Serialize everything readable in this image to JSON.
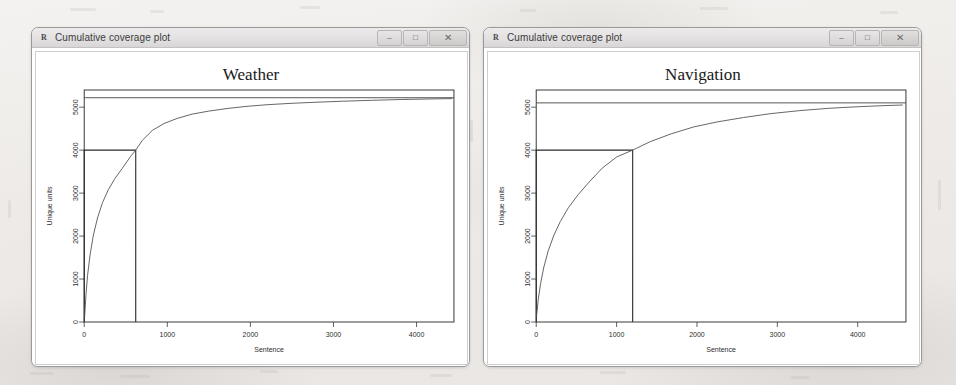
{
  "page": {
    "background_color": "#f0eeec",
    "paper_scan": true
  },
  "windows": [
    {
      "id": "weather-window",
      "titlebar": {
        "icon": "r-graphics-icon",
        "title": "Cumulative coverage plot",
        "buttons": [
          {
            "name": "minimize-button",
            "glyph": "–"
          },
          {
            "name": "maximize-button",
            "glyph": "□"
          },
          {
            "name": "close-button",
            "glyph": "✕"
          }
        ]
      },
      "chart_data": {
        "type": "line",
        "title": "Weather",
        "xlabel": "Sentence",
        "ylabel": "Unique units",
        "xlim": [
          0,
          4450
        ],
        "ylim": [
          0,
          5400
        ],
        "xticks": [
          0,
          1000,
          2000,
          3000,
          4000
        ],
        "yticks": [
          0,
          1000,
          2000,
          3000,
          4000,
          5000
        ],
        "grid": false,
        "legend": null,
        "series": [
          {
            "name": "Cumulative unique units",
            "x": [
              5,
              20,
              40,
              70,
              110,
              160,
              220,
              290,
              370,
              460,
              560,
              620,
              700,
              820,
              960,
              1120,
              1300,
              1500,
              1720,
              1960,
              2220,
              2500,
              2800,
              3120,
              3460,
              3820,
              4200,
              4430
            ],
            "y": [
              120,
              620,
              1080,
              1560,
              2020,
              2420,
              2780,
              3080,
              3340,
              3580,
              3860,
              4000,
              4230,
              4460,
              4620,
              4740,
              4840,
              4910,
              4970,
              5020,
              5060,
              5090,
              5115,
              5140,
              5160,
              5178,
              5192,
              5200
            ]
          }
        ],
        "annotations": [
          {
            "name": "asymptote-line",
            "type": "hline",
            "y": 5220,
            "label": null
          },
          {
            "name": "threshold-rectangle",
            "type": "rect",
            "x0": 0,
            "y0": 0,
            "x1": 620,
            "y1": 4000,
            "label": null
          }
        ]
      }
    },
    {
      "id": "navigation-window",
      "titlebar": {
        "icon": "r-graphics-icon",
        "title": "Cumulative coverage plot",
        "buttons": [
          {
            "name": "minimize-button",
            "glyph": "–"
          },
          {
            "name": "maximize-button",
            "glyph": "□"
          },
          {
            "name": "close-button",
            "glyph": "✕"
          }
        ]
      },
      "chart_data": {
        "type": "line",
        "title": "Navigation",
        "xlabel": "Sentence",
        "ylabel": "Unique units",
        "xlim": [
          0,
          4600
        ],
        "ylim": [
          0,
          5400
        ],
        "xticks": [
          0,
          1000,
          2000,
          3000,
          4000
        ],
        "yticks": [
          0,
          1000,
          2000,
          3000,
          4000,
          5000
        ],
        "grid": false,
        "legend": null,
        "series": [
          {
            "name": "Cumulative unique units",
            "x": [
              5,
              25,
              55,
              95,
              150,
              220,
              300,
              400,
              520,
              660,
              820,
              1000,
              1200,
              1420,
              1680,
              1960,
              2260,
              2580,
              2920,
              3280,
              3640,
              3980,
              4300,
              4560
            ],
            "y": [
              150,
              520,
              900,
              1280,
              1660,
              2020,
              2340,
              2660,
              2960,
              3260,
              3580,
              3840,
              4000,
              4200,
              4380,
              4540,
              4660,
              4760,
              4850,
              4920,
              4975,
              5010,
              5035,
              5050
            ]
          }
        ],
        "annotations": [
          {
            "name": "asymptote-line",
            "type": "hline",
            "y": 5100,
            "label": null
          },
          {
            "name": "threshold-rectangle",
            "type": "rect",
            "x0": 0,
            "y0": 0,
            "x1": 1200,
            "y1": 4000,
            "label": null
          }
        ]
      }
    }
  ]
}
